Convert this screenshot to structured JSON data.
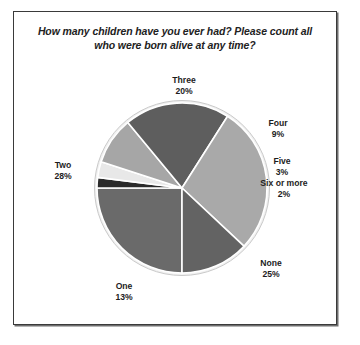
{
  "chart_data": {
    "type": "pie",
    "title": "How many children have you ever had? Please count all who were born alive at any time?",
    "title_line1": "How many children have you ever had? Please count all",
    "title_line2": "who were born alive at any time?",
    "xlabel": "",
    "ylabel": "",
    "legend": "none",
    "grid": false,
    "labels_show_percent": true,
    "categories": [
      "None",
      "One",
      "Two",
      "Three",
      "Four",
      "Five",
      "Six or more"
    ],
    "values": [
      25,
      13,
      28,
      20,
      9,
      3,
      2
    ],
    "value_labels": [
      "25%",
      "13%",
      "28%",
      "20%",
      "9%",
      "3%",
      "2%"
    ],
    "colors": [
      "#6a6a6a",
      "#636363",
      "#a9a9a9",
      "#5e5e5e",
      "#a6a6a6",
      "#e8e8e8",
      "#2b2b2b"
    ],
    "slices": [
      {
        "name": "None",
        "value": 25,
        "value_label": "25%",
        "color": "#6a6a6a"
      },
      {
        "name": "One",
        "value": 13,
        "value_label": "13%",
        "color": "#636363"
      },
      {
        "name": "Two",
        "value": 28,
        "value_label": "28%",
        "color": "#a9a9a9"
      },
      {
        "name": "Three",
        "value": 20,
        "value_label": "20%",
        "color": "#5e5e5e"
      },
      {
        "name": "Four",
        "value": 9,
        "value_label": "9%",
        "color": "#a6a6a6"
      },
      {
        "name": "Five",
        "value": 3,
        "value_label": "3%",
        "color": "#e8e8e8"
      },
      {
        "name": "Six or more",
        "value": 2,
        "value_label": "2%",
        "color": "#2b2b2b"
      }
    ]
  },
  "frame": {
    "border_color": "#3a3a3a",
    "background": "#ffffff"
  },
  "labels": {
    "three": {
      "name": "Three",
      "value": "20%"
    },
    "four": {
      "name": "Four",
      "value": "9%"
    },
    "five": {
      "name": "Five",
      "value": "3%"
    },
    "six": {
      "name": "Six or more",
      "value": "2%"
    },
    "none": {
      "name": "None",
      "value": "25%"
    },
    "one": {
      "name": "One",
      "value": "13%"
    },
    "two": {
      "name": "Two",
      "value": "28%"
    }
  }
}
